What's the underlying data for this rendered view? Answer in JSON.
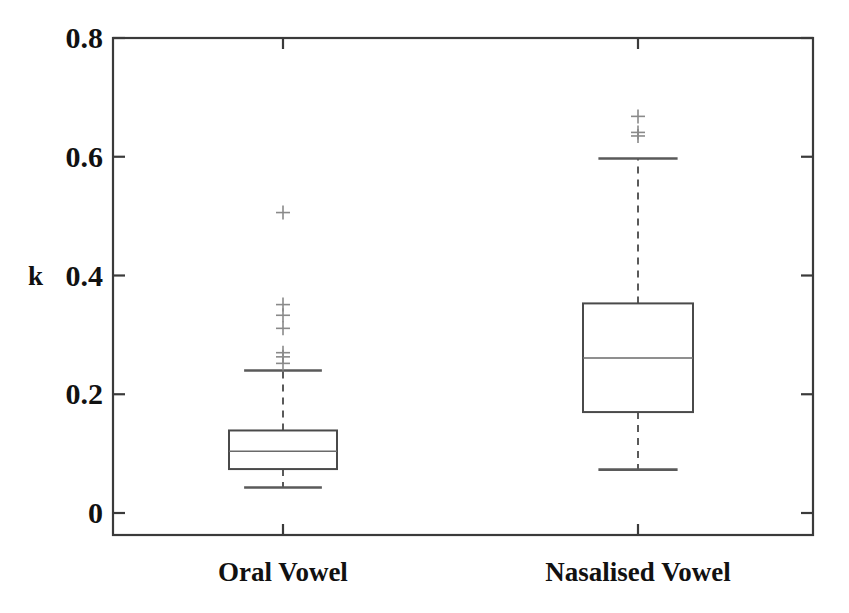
{
  "chart_data": {
    "type": "box",
    "title": "",
    "xlabel": "",
    "ylabel": "k",
    "ylim": [
      0,
      0.8
    ],
    "yticks": [
      0,
      0.2,
      0.4,
      0.6,
      0.8
    ],
    "ytick_labels": [
      "0",
      "0.2",
      "0.4",
      "0.6",
      "0.8"
    ],
    "categories": [
      "Oral Vowel",
      "Nasalised Vowel"
    ],
    "grid": false,
    "legend": "none",
    "outlier_marker": "+",
    "boxes": [
      {
        "name": "Oral Vowel",
        "whisker_low": 0.043,
        "q1": 0.074,
        "median": 0.104,
        "q3": 0.139,
        "whisker_high": 0.24,
        "outliers": [
          0.252,
          0.263,
          0.27,
          0.311,
          0.333,
          0.351,
          0.506
        ]
      },
      {
        "name": "Nasalised Vowel",
        "whisker_low": 0.073,
        "q1": 0.17,
        "median": 0.261,
        "q3": 0.353,
        "whisker_high": 0.597,
        "outliers": [
          0.635,
          0.641,
          0.668
        ]
      }
    ],
    "colors": {
      "axis": "#3a3a3a",
      "box": "#4a4a4a",
      "median": "#6a6a6a",
      "whisker": "#5a5a5a",
      "outlier": "#8a8a8a",
      "background": "#ffffff",
      "text": "#111111"
    }
  }
}
